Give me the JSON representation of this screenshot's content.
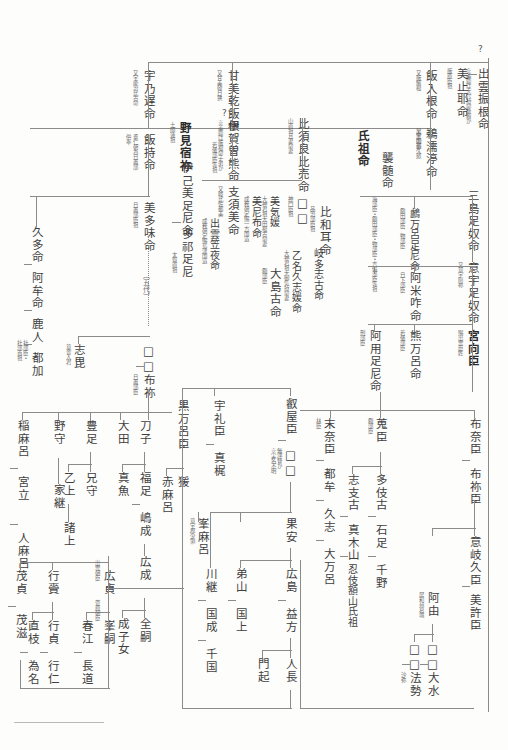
{
  "document": {
    "type": "genealogy-chart",
    "title": "出雲国造家系図",
    "orientation": "vertical-rtl",
    "unknown_marker": "?",
    "square_placeholder": "□"
  },
  "generation1": {
    "root": {
      "name": "出雲振根命",
      "annotation": "※美鹿は大穴持命後裔か"
    },
    "spouse_or_sibling": {
      "name": "美止耶命",
      "annotation": "飯原臣祖"
    },
    "question": "?"
  },
  "generation2": [
    {
      "name": "宇乃遅命",
      "annotation": "又宇能治比古命"
    },
    {
      "name": "甘美乾飯根",
      "annotation": "又甘美韓日狭"
    },
    {
      "name": "飯入根命",
      "annotation": "又飯解根"
    },
    {
      "name": "出雲国造",
      "annotation": ""
    }
  ],
  "generation3": [
    {
      "name": "飯持命",
      "annotation": "垂仁朝為日置部",
      "annotation2": "供奉"
    },
    {
      "name": "野見宿祢",
      "annotation": "土師連祖",
      "bold": true
    },
    {
      "name": "伊賀曽熊命",
      "annotation": "※美鹿は飯根命子弟か",
      "annotation2": "若倭部臣等祖"
    },
    {
      "name": "比須良比売命",
      "annotation": "山直祖且妻命妻"
    },
    {
      "name": "鵜濡渟命",
      "annotation": "又宇如都久怒"
    },
    {
      "name": "氏祖命",
      "bold": true
    },
    {
      "name": "三島足奴命"
    }
  ],
  "generation4": [
    {
      "name": "伊己美足尼命",
      "annotation": ""
    },
    {
      "name": "多祁足尼",
      "annotation": "太賀直祖"
    },
    {
      "name": "美多味命",
      "annotation": "日置部臣祖"
    },
    {
      "name": "支須美命",
      "annotation": "又岐比佐都美"
    },
    {
      "name": "美尼布命",
      "annotation": "成務朝定賜一方国造"
    },
    {
      "name": "美気媛",
      "annotation": "大神君祖大田根古命妻"
    },
    {
      "name": "出雲笠夜命",
      "annotation": "成務朝定賜島津国造"
    },
    {
      "name": "比和耳命",
      "annotation": "品治部臣祖"
    },
    {
      "name": "襲髄命",
      "annotation": "海部臣・額田部臣・物部臣・吉備部臣等祖"
    },
    {
      "name": "鸕万呂足尼命",
      "annotation": "額田部臣、物部臣"
    },
    {
      "name": "意宇足奴命",
      "annotation": "又意宇阿祢"
    }
  ],
  "generation5": [
    {
      "name": "□□",
      "annotation": "神門臣祖"
    },
    {
      "name": "古祢建部臣祖",
      "annotation": ""
    },
    {
      "name": "乙名久志媛命",
      "annotation": "大神君祖大御気持命妻"
    },
    {
      "name": "岐多志古命",
      "annotation": "財部臣祖"
    },
    {
      "name": "大島古命",
      "annotation": "額部臣"
    },
    {
      "name": "阿米咋命",
      "annotation": "日下部臣"
    },
    {
      "name": "宮向臣",
      "annotation": "賜出雲臣姓",
      "bold": true
    },
    {
      "name": "熊万呂命",
      "annotation": "若倭部臣"
    },
    {
      "name": "阿用足尼命",
      "annotation": "刑部臣"
    }
  ],
  "generation6": {
    "left_branch": [
      {
        "name": "久多命"
      },
      {
        "name": "阿牟命"
      },
      {
        "name": "鹿人",
        "annotation": "社部臣・"
      },
      {
        "name": "都加",
        "annotation": "社部首祖"
      }
    ],
    "mid": [
      {
        "name": "志毘",
        "annotation": "意舎入君"
      },
      {
        "name": "□□"
      },
      {
        "name": "布祢",
        "annotation": "日置部臣"
      }
    ],
    "right": [
      {
        "name": "布奈臣"
      },
      {
        "name": "布祢臣"
      },
      {
        "name": "意岐久臣"
      },
      {
        "name": "美許臣"
      },
      {
        "name": "蒐臣",
        "annotation": "額部臣"
      },
      {
        "name": "末奈臣",
        "annotation": "林臣"
      }
    ],
    "generations_note": "〔五代〕"
  },
  "lower_left": [
    {
      "name": "稲麻呂"
    },
    {
      "name": "宮立"
    },
    {
      "name": "人麻呂"
    },
    {
      "name": "野守"
    },
    {
      "name": "豊足"
    },
    {
      "name": "乙上"
    },
    {
      "name": "兄守"
    },
    {
      "name": "諸上"
    },
    {
      "name": "家継"
    },
    {
      "name": "茂貞"
    },
    {
      "name": "茂滋"
    },
    {
      "name": "行賫"
    },
    {
      "name": "行貞"
    },
    {
      "name": "直枝"
    },
    {
      "name": "為名"
    },
    {
      "name": "行仁"
    },
    {
      "name": "広貞",
      "annotation": "出雲朝臣"
    },
    {
      "name": "峯嗣",
      "annotation": "菅原朝臣"
    },
    {
      "name": "春江"
    },
    {
      "name": "長道"
    },
    {
      "name": "成子女"
    }
  ],
  "lower_mid": [
    {
      "name": "大田"
    },
    {
      "name": "刀子"
    },
    {
      "name": "福足"
    },
    {
      "name": "真魚"
    },
    {
      "name": "嶋成"
    },
    {
      "name": "広成"
    },
    {
      "name": "全嗣"
    },
    {
      "name": "成子女"
    },
    {
      "name": "黒万呂臣"
    },
    {
      "name": "猨"
    },
    {
      "name": "赤麻呂"
    },
    {
      "name": "宇礼臣"
    },
    {
      "name": "真梶"
    },
    {
      "name": "峯麻呂",
      "annotation": "意宇郡少領"
    }
  ],
  "lower_right": [
    {
      "name": "叡屋臣"
    },
    {
      "name": "□□",
      "annotation": "無評督か",
      "annotation2": "※実名不明"
    },
    {
      "name": "果安"
    },
    {
      "name": "広島"
    },
    {
      "name": "益方"
    },
    {
      "name": "弟山"
    },
    {
      "name": "国上"
    },
    {
      "name": "川継"
    },
    {
      "name": "国成"
    },
    {
      "name": "千国"
    },
    {
      "name": "門起"
    },
    {
      "name": "人長"
    }
  ],
  "far_right": [
    {
      "name": "末奈臣"
    },
    {
      "name": "都牟"
    },
    {
      "name": "久志"
    },
    {
      "name": "大万呂"
    },
    {
      "name": "志支古"
    },
    {
      "name": "真木山"
    },
    {
      "name": "忍伎額山氏祖"
    },
    {
      "name": "多伎古"
    },
    {
      "name": "石足"
    },
    {
      "name": "千野"
    },
    {
      "name": "阿由",
      "annotation": "居和州葛城"
    },
    {
      "name": "□□"
    },
    {
      "name": "□□"
    },
    {
      "name": "大水"
    },
    {
      "name": "法勢",
      "annotation": "沙弥"
    }
  ]
}
